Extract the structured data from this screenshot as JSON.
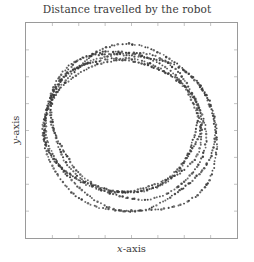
{
  "chart_data": {
    "type": "scatter",
    "title": "Distance travelled by the robot",
    "xlabel_var": "x",
    "xlabel_rest": "-axis",
    "ylabel_var": "y",
    "ylabel_rest": "-axis",
    "xlim": [
      0,
      10
    ],
    "ylim": [
      0,
      10
    ],
    "grid": false,
    "legend": null,
    "ticks": {
      "x_count": 7,
      "y_count": 7,
      "labels": false
    },
    "marker": {
      "shape": "dot",
      "color": "#3c3c3c",
      "size": 1.1
    },
    "series": [
      {
        "name": "loop-1",
        "cx": 4.65,
        "cy": 5.3,
        "rx": 3.55,
        "ry": 3.1,
        "tilt_deg": -12,
        "points": 150
      },
      {
        "name": "loop-2",
        "cx": 4.75,
        "cy": 5.2,
        "rx": 3.85,
        "ry": 3.35,
        "tilt_deg": -14,
        "points": 160
      },
      {
        "name": "loop-3",
        "cx": 4.9,
        "cy": 5.05,
        "rx": 4.05,
        "ry": 3.6,
        "tilt_deg": -16,
        "points": 170
      },
      {
        "name": "loop-4",
        "cx": 4.55,
        "cy": 5.35,
        "rx": 3.7,
        "ry": 3.25,
        "tilt_deg": -8,
        "points": 150
      },
      {
        "name": "loop-5",
        "cx": 5.0,
        "cy": 4.95,
        "rx": 4.15,
        "ry": 3.85,
        "tilt_deg": -18,
        "points": 170
      },
      {
        "name": "loop-6",
        "cx": 4.7,
        "cy": 5.25,
        "rx": 3.45,
        "ry": 3.05,
        "tilt_deg": -10,
        "points": 140
      }
    ]
  }
}
